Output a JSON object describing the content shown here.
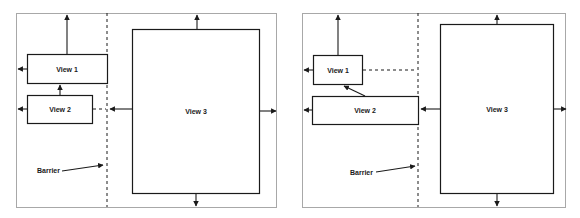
{
  "diagrams": [
    {
      "id": "left",
      "views": [
        {
          "label": "View 1"
        },
        {
          "label": "View 2"
        },
        {
          "label": "View 3"
        }
      ],
      "barrier_label": "Barrier"
    },
    {
      "id": "right",
      "views": [
        {
          "label": "View 1"
        },
        {
          "label": "View 2"
        },
        {
          "label": "View 3"
        }
      ],
      "barrier_label": "Barrier"
    }
  ],
  "colors": {
    "frame": "#a8a8a8",
    "stroke": "#1a1a1a",
    "background": "#ffffff"
  }
}
